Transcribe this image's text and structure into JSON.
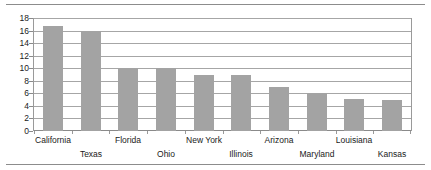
{
  "chart_data": {
    "type": "bar",
    "title": "",
    "subtitle": "",
    "xlabel": "",
    "ylabel": "",
    "categories": [
      "California",
      "Texas",
      "Florida",
      "Ohio",
      "New York",
      "Illinois",
      "Arizona",
      "Maryland",
      "Louisiana",
      "Kansas"
    ],
    "values": [
      16.8,
      16.0,
      10.0,
      10.0,
      8.9,
      8.9,
      7.0,
      6.0,
      5.1,
      5.0
    ],
    "series": [
      {
        "name": "",
        "values": [
          16.8,
          16.0,
          10.0,
          10.0,
          8.9,
          8.9,
          7.0,
          6.0,
          5.1,
          5.0
        ]
      }
    ],
    "ylim": [
      0,
      18
    ],
    "ytick_values": [
      0,
      2,
      4,
      6,
      8,
      10,
      12,
      14,
      16,
      18
    ],
    "ytick_labels": [
      "0",
      "2",
      "4",
      "6",
      "8",
      "10",
      "12",
      "14",
      "16",
      "18"
    ],
    "grid": true,
    "grid_axis": "y",
    "legend": false,
    "legend_position": "none",
    "bar_color": "#a3a3a3",
    "gridline_color": "#a6a6a6",
    "axis_color": "#8a8a8a",
    "text_color": "#1a1a1a",
    "background_color": "#ffffff",
    "annotations": [],
    "category_label_rows": [
      0,
      1,
      0,
      1,
      0,
      1,
      0,
      1,
      0,
      1
    ]
  },
  "frame": {
    "rule_color": "#8c8c8c"
  }
}
